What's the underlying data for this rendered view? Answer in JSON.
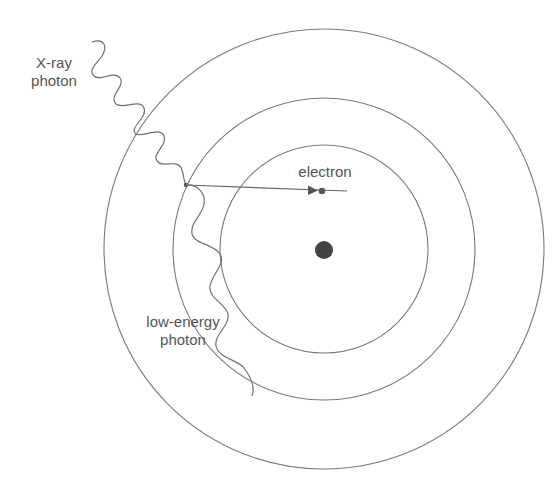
{
  "diagram": {
    "type": "atom-x-ray-photon-interaction",
    "labels": {
      "xray_line1": "X-ray",
      "xray_line2": "photon",
      "electron": "electron",
      "low_energy_line1": "low-energy",
      "low_energy_line2": "photon"
    },
    "colors": {
      "line": "#777777",
      "nucleus": "#444444",
      "text": "#555555",
      "background": "#ffffff"
    },
    "geometry": {
      "center": [
        324,
        249
      ],
      "shell_radii": [
        104,
        151,
        220
      ],
      "nucleus_radius": 9,
      "electron_position": [
        322,
        191
      ],
      "interaction_point": [
        186,
        185
      ]
    }
  }
}
